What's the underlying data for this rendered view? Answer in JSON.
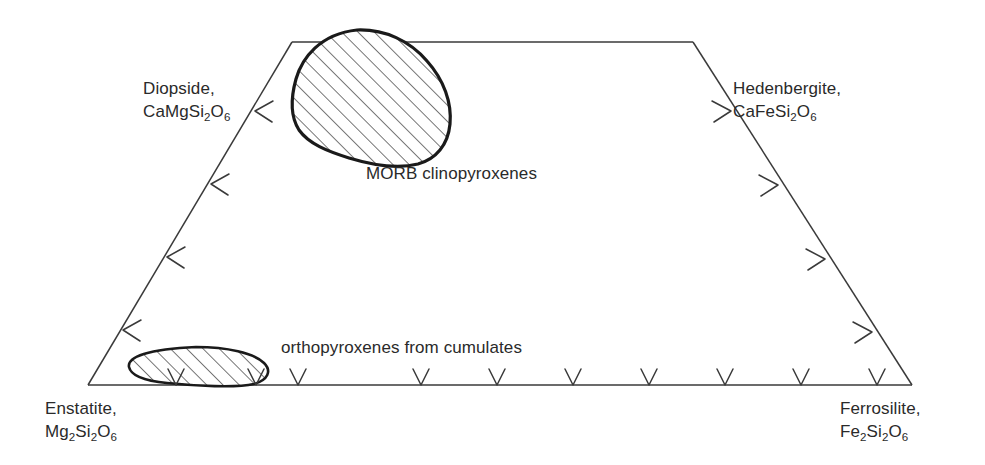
{
  "figure": {
    "type": "pyroxene-quadrilateral",
    "background_color": "#ffffff",
    "line_color": "#3a3a3a",
    "field_outline_color": "#1a1a1a",
    "hatch_color": "#4a4a4a",
    "text_color": "#2a2a2a"
  },
  "vertices": [
    {
      "id": "diopside",
      "name": "Diopside",
      "label_line1": "Diopside,",
      "formula_parts": [
        {
          "t": "CaMgSi",
          "sub": false
        },
        {
          "t": "2",
          "sub": true
        },
        {
          "t": "O",
          "sub": false
        },
        {
          "t": "6",
          "sub": true
        }
      ],
      "corner": "top-left",
      "x": 292,
      "y": 42
    },
    {
      "id": "hedenbergite",
      "name": "Hedenbergite",
      "label_line1": "Hedenbergite,",
      "formula_parts": [
        {
          "t": "CaFeSi",
          "sub": false
        },
        {
          "t": "2",
          "sub": true
        },
        {
          "t": "O",
          "sub": false
        },
        {
          "t": "6",
          "sub": true
        }
      ],
      "corner": "top-right",
      "x": 693,
      "y": 42
    },
    {
      "id": "enstatite",
      "name": "Enstatite",
      "label_line1": "Enstatite,",
      "formula_parts": [
        {
          "t": "Mg",
          "sub": false
        },
        {
          "t": "2",
          "sub": true
        },
        {
          "t": "Si",
          "sub": false
        },
        {
          "t": "2",
          "sub": true
        },
        {
          "t": "O",
          "sub": false
        },
        {
          "t": "6",
          "sub": true
        }
      ],
      "corner": "bottom-left",
      "x": 88,
      "y": 385
    },
    {
      "id": "ferrosilite",
      "name": "Ferrosilite",
      "label_line1": "Ferrosilite,",
      "formula_parts": [
        {
          "t": "Fe",
          "sub": false
        },
        {
          "t": "2",
          "sub": true
        },
        {
          "t": "Si",
          "sub": false
        },
        {
          "t": "2",
          "sub": true
        },
        {
          "t": "O",
          "sub": false
        },
        {
          "t": "6",
          "sub": true
        }
      ],
      "corner": "bottom-right",
      "x": 912,
      "y": 385
    }
  ],
  "fields": [
    {
      "id": "morb-clinopyroxenes",
      "caption": "MORB clinopyroxenes",
      "hatched": true,
      "outline_weight": 3.2,
      "shape": "rounded-blob",
      "bbox": [
        293,
        30,
        455,
        167
      ]
    },
    {
      "id": "orthopyroxenes-from-cumulates",
      "caption": "orthopyroxenes from cumulates",
      "hatched": true,
      "outline_weight": 2.6,
      "shape": "flat-ellipse",
      "bbox": [
        128,
        347,
        268,
        386
      ]
    }
  ],
  "axes": {
    "bottom": {
      "id": "en-fs-join",
      "from": "enstatite",
      "to": "ferrosilite",
      "tick_count": 9,
      "tick_glyph": "V"
    },
    "left": {
      "id": "en-di-join",
      "from": "enstatite",
      "to": "diopside",
      "tick_count": 4,
      "tick_glyph": "<"
    },
    "right": {
      "id": "hd-fs-join",
      "from": "hedenbergite",
      "to": "ferrosilite",
      "tick_count": 4,
      "tick_glyph": ">"
    },
    "top": {
      "id": "di-hd-join",
      "from": "diopside",
      "to": "hedenbergite",
      "tick_count": 0,
      "tick_glyph": ""
    }
  }
}
